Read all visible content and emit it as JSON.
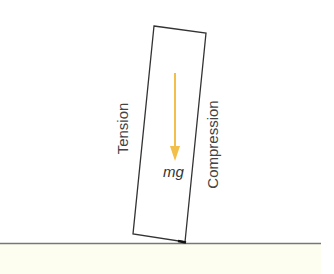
{
  "diagram": {
    "block": {
      "label": "leaning block"
    },
    "force_arrow": {
      "label": "mg",
      "color": "#f2c04a"
    },
    "left_side_label": "Tension",
    "right_side_label": "Compression",
    "ground": {
      "line_color": "#777777",
      "fill_color": "#fefef0"
    }
  }
}
